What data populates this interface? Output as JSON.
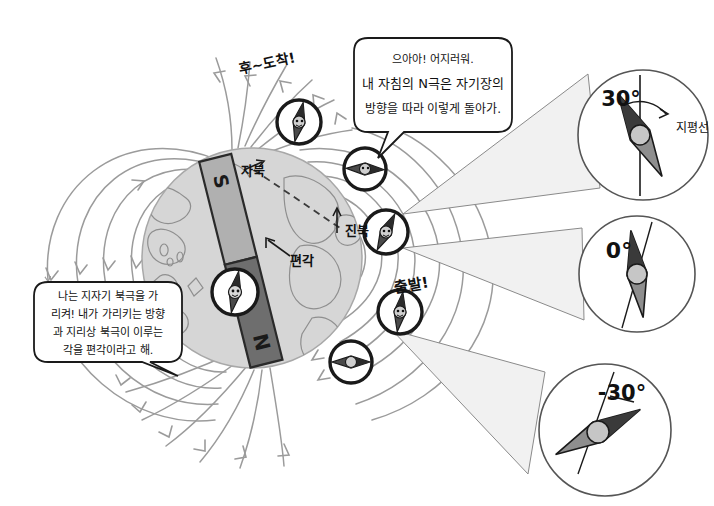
{
  "diagram": {
    "background_color": "#ffffff",
    "globe_fill": "#d6d6d6",
    "field_line_color": "#9b9b9b",
    "cone_fill": "#f1f1f1",
    "magnet_s_fill": "#b0b0b0",
    "magnet_n_fill": "#6e6e6e",
    "ink_color": "#1a1a1a"
  },
  "speech_bubbles": [
    {
      "id": "top-bubble",
      "lines": [
        "으아아! 어지러워.",
        "내 자침의 N극은 자기장의",
        "방향을 따라 이렇게 돌아가."
      ]
    },
    {
      "id": "left-bubble",
      "lines": [
        "나는 지자기 북극을 가",
        "리켜! 내가 가리키는 방향",
        "과 지리상 북극이 이루는",
        "각을 편각이라고 해."
      ]
    }
  ],
  "globe_labels": {
    "magnetic_north": "자북",
    "true_north": "진북",
    "declination": "편각",
    "magnet_south_pole": "S",
    "magnet_north_pole": "N"
  },
  "path_labels": {
    "arrive": "후~도착!",
    "start": "출발!"
  },
  "magnifiers": [
    {
      "id": "magnifier-top",
      "angle_label": "30°",
      "reference_label": "지평선",
      "needle_tilt_deg": -30
    },
    {
      "id": "magnifier-middle",
      "angle_label": "0°",
      "reference_label": "",
      "needle_tilt_deg": 0
    },
    {
      "id": "magnifier-bottom",
      "angle_label": "-30°",
      "reference_label": "",
      "needle_tilt_deg": 60
    }
  ],
  "compasses": [
    {
      "id": "compass-arrive",
      "cx": 299,
      "cy": 122,
      "r": 22,
      "needle_deg": 10
    },
    {
      "id": "compass-globe",
      "cx": 235,
      "cy": 292,
      "r": 22,
      "needle_deg": 10
    },
    {
      "id": "compass-upper-right",
      "cx": 365,
      "cy": 169,
      "r": 21,
      "needle_deg": 90
    },
    {
      "id": "compass-mid-right",
      "cx": 386,
      "cy": 232,
      "r": 22,
      "needle_deg": 25
    },
    {
      "id": "compass-start",
      "cx": 400,
      "cy": 312,
      "r": 22,
      "needle_deg": 10
    },
    {
      "id": "compass-lower-right",
      "cx": 351,
      "cy": 362,
      "r": 21,
      "needle_deg": 90
    }
  ]
}
